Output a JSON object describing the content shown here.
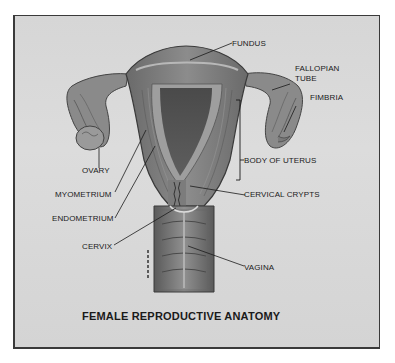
{
  "diagram": {
    "title": "FEMALE REPRODUCTIVE ANATOMY",
    "labels": {
      "fundus": "FUNDUS",
      "fallopian_tube_line1": "FALLOPIAN",
      "fallopian_tube_line2": "TUBE",
      "fimbria": "FIMBRIA",
      "ovary": "OVARY",
      "body_of_uterus": "BODY OF UTERUS",
      "myometrium": "MYOMETRIUM",
      "cervical_crypts": "CERVICAL CRYPTS",
      "endometrium": "ENDOMETRIUM",
      "cervix": "CERVIX",
      "vagina": "VAGINA"
    },
    "colors": {
      "background": "#d8d8d8",
      "frame_border": "#3a3a3a",
      "tissue_dark": "#555555",
      "tissue_mid": "#7a7a7a",
      "tissue_light": "#a8a8a8",
      "text": "#1a1a1a"
    }
  }
}
